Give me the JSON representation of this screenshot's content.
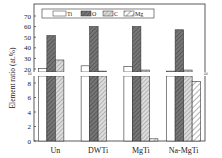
{
  "chart_data": {
    "type": "bar",
    "title": "",
    "xlabel": "",
    "ylabel": "Element ratio (at.%)",
    "categories": [
      "Un",
      "DWTi",
      "MgTi",
      "Na-MgTi"
    ],
    "series": [
      {
        "name": "Ti",
        "values": [
          20.5,
          23,
          22.5,
          18
        ]
      },
      {
        "name": "O",
        "values": [
          51.5,
          60,
          60,
          57
        ]
      },
      {
        "name": "C",
        "values": [
          28.5,
          18,
          19,
          19
        ]
      },
      {
        "name": "Mg",
        "values": [
          null,
          null,
          0.3,
          8.2
        ]
      }
    ],
    "axis_break": {
      "lower_range": [
        0,
        9
      ],
      "upper_range": [
        18,
        73
      ]
    },
    "lower_ticks": [
      0,
      2,
      4,
      6,
      8
    ],
    "upper_ticks": [
      20,
      30,
      40,
      50,
      60,
      70
    ],
    "legend_position": "top-inside",
    "grid": false
  },
  "legend": [
    "Ti",
    "O",
    "C",
    "Mg"
  ],
  "ylabel": "Element ratio (at.%)",
  "categories": [
    "Un",
    "DWTi",
    "MgTi",
    "Na-MgTi"
  ]
}
